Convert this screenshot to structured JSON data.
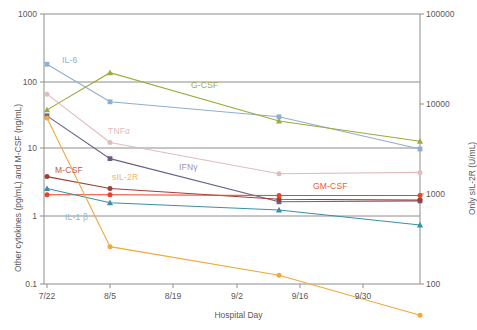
{
  "chart_data": {
    "type": "line",
    "title": "",
    "xlabel": "Hospital Day",
    "ylabel": "Other cytokines (pg/mL) and M-CSF (ng/mL)",
    "y2label": "Only sIL-2R (U/mL)",
    "x_tick_labels": [
      "7/22",
      "8/5",
      "8/19",
      "9/2",
      "9/16",
      "9/30"
    ],
    "y_tick_labels": [
      "1000",
      "100",
      "10",
      "1",
      "0.1"
    ],
    "y2_tick_labels": [
      "100000",
      "10000",
      "1000",
      "100"
    ],
    "yscale": "log",
    "y2scale": "log",
    "ylim": [
      0.1,
      1000
    ],
    "y2lim": [
      100,
      100000
    ],
    "grid": "horizontal",
    "legend": "inline-labels",
    "x": [
      "7/22",
      "8/5",
      "9/9",
      "10/7"
    ],
    "series": [
      {
        "name": "IL-6",
        "color": "#8eaed2",
        "label_color": "#8eaed2",
        "marker": "square",
        "axis": "left",
        "values": [
          180,
          50,
          30,
          10
        ]
      },
      {
        "name": "G-CSF",
        "color": "#9cab3a",
        "label_color": "#9cab3a",
        "marker": "triangle",
        "axis": "left",
        "values": [
          38,
          135,
          26,
          13
        ]
      },
      {
        "name": "TNFα",
        "color": "#e0bcbe",
        "label_color": "#e0bcbe",
        "marker": "circle",
        "axis": "left",
        "values": [
          65,
          12.5,
          4.3,
          4.5
        ]
      },
      {
        "name": "IFNγ",
        "color": "#6a5f86",
        "label_color": "#9a94ab",
        "marker": "square",
        "axis": "left",
        "values": [
          31,
          7.2,
          1.65,
          1.7
        ]
      },
      {
        "name": "M-CSF",
        "color": "#9e3f36",
        "label_color": "#c0564a",
        "marker": "circle",
        "axis": "left",
        "values": [
          3.9,
          2.6,
          1.8,
          1.75
        ]
      },
      {
        "name": "GM-CSF",
        "color": "#ef4123",
        "label_color": "#ef5a3a",
        "marker": "circle",
        "axis": "left",
        "values": [
          2.1,
          2.1,
          2.05,
          2.05
        ]
      },
      {
        "name": "IL-1 β",
        "color": "#3b8fa8",
        "label_color": "#8fb8c4",
        "marker": "triangle",
        "axis": "left",
        "values": [
          2.6,
          1.6,
          1.25,
          0.75
        ]
      },
      {
        "name": "sIL-2R",
        "color": "#f0a93c",
        "label_color": "#f0b45c",
        "marker": "circle",
        "axis": "right",
        "values": [
          7000,
          260,
          125,
          45
        ]
      }
    ],
    "annotations": [
      {
        "text": "IL-6",
        "x": 62,
        "y": 55,
        "color": "#8eaed2"
      },
      {
        "text": "G-CSF",
        "x": 191,
        "y": 80,
        "color": "#9cab3a"
      },
      {
        "text": "TNFα",
        "x": 108,
        "y": 126,
        "color": "#e0bcbe"
      },
      {
        "text": "IFNγ",
        "x": 179,
        "y": 162,
        "color": "#9a94ab"
      },
      {
        "text": "M-CSF",
        "x": 55,
        "y": 165,
        "color": "#c0564a"
      },
      {
        "text": "sIL-2R",
        "x": 112,
        "y": 172,
        "color": "#f0b45c"
      },
      {
        "text": "GM-CSF",
        "x": 313,
        "y": 181,
        "color": "#ef5a3a"
      },
      {
        "text": "IL-1 β",
        "x": 65,
        "y": 212,
        "color": "#8fb8c4"
      }
    ]
  },
  "geometry": {
    "plot_left": 44,
    "plot_right": 420,
    "plot_top": 14,
    "plot_bottom": 284,
    "x_positions": [
      47,
      110,
      279,
      420
    ],
    "x_tick_positions": [
      47,
      110,
      173,
      237,
      300,
      363
    ],
    "y_gridlines": [
      14,
      82,
      148,
      216,
      284
    ],
    "y2_gridlines": [
      14,
      104,
      194,
      284
    ]
  }
}
